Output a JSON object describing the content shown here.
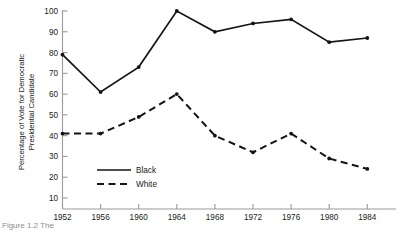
{
  "chart_data": {
    "type": "line",
    "title": "",
    "xlabel": "",
    "ylabel": "Percentage of Vote for Democratic Presidential Candidate",
    "ylabel_line1": "Percentage of Vote for Democratic",
    "ylabel_line2": "Presidential Candidate",
    "categories": [
      "1952",
      "1956",
      "1960",
      "1964",
      "1968",
      "1972",
      "1976",
      "1980",
      "1984"
    ],
    "x": [
      1952,
      1956,
      1960,
      1964,
      1968,
      1972,
      1976,
      1980,
      1984
    ],
    "xlim": [
      1952,
      1984
    ],
    "ylim": [
      0,
      100
    ],
    "yticks": [
      "10",
      "20",
      "30",
      "40",
      "50",
      "60",
      "70",
      "80",
      "90",
      "100"
    ],
    "ytick_values": [
      10,
      20,
      30,
      40,
      50,
      60,
      70,
      80,
      90,
      100
    ],
    "grid": false,
    "legend_position": "lower-center-left",
    "series": [
      {
        "name": "Black",
        "style": "solid",
        "color": "#141414",
        "marker": "dot",
        "values": [
          79,
          61,
          73,
          100,
          90,
          94,
          96,
          85,
          87
        ]
      },
      {
        "name": "White",
        "style": "dashed",
        "color": "#141414",
        "marker": "dot",
        "values": [
          41,
          41,
          49,
          60,
          40,
          32,
          41,
          29,
          24
        ]
      }
    ]
  },
  "legend": {
    "items": [
      {
        "label": "Black",
        "style": "solid"
      },
      {
        "label": "White",
        "style": "dashed"
      }
    ]
  },
  "caption": {
    "text": "Figure 1.2  The",
    "visible": true
  },
  "colors": {
    "ink": "#141414",
    "axis": "#9a9a9a",
    "background": "#ffffff"
  }
}
